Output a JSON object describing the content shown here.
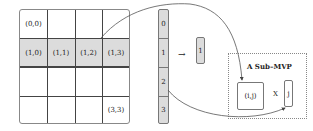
{
  "matrix": {
    "rows": 4,
    "cols": 4,
    "highlighted_row": 1,
    "labels": {
      "c00": "(0,0)",
      "c10": "(1,0)",
      "c11": "(1,1)",
      "c12": "(1,2)",
      "c13": "(1,3)",
      "c33": "(3,3)"
    }
  },
  "vector": {
    "segments": [
      "0",
      "1",
      "2",
      "3"
    ]
  },
  "selected_vector": {
    "label": "1",
    "arrow": "→"
  },
  "sub_mvp": {
    "title": "A Sub–MVP",
    "matrix_label": "(i,j)",
    "operator": "X",
    "vector_label": "j"
  },
  "colors": {
    "highlight": "#dcdcdc",
    "border": "#777777"
  }
}
